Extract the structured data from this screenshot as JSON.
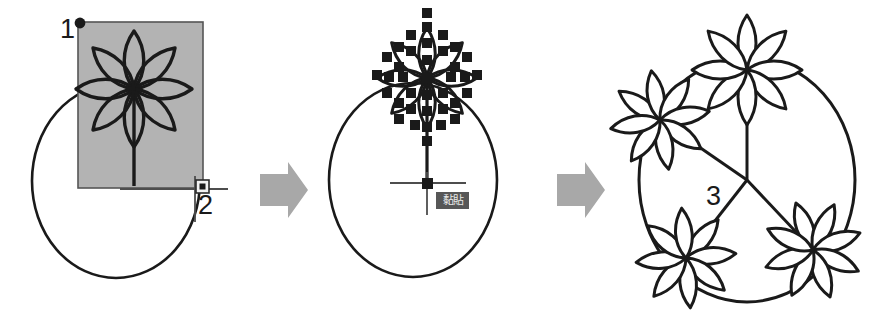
{
  "figure": {
    "background_color": "#ffffff",
    "stroke_color": "#1a1a1a",
    "selection_fill_color": "#b3b3b3",
    "arrow_color": "#a8a8a8",
    "tooltip_bg_color": "#575757",
    "tooltip_text_color": "#e8e8e8"
  },
  "steps": [
    {
      "id": "step-1",
      "label": "1",
      "caption": "1",
      "description": "Flower selected inside shaded selection rectangle on circle"
    },
    {
      "id": "step-2",
      "label": "2",
      "caption": "2",
      "description": "Base point picked at crosshair with square snap marker"
    },
    {
      "id": "step-3",
      "label": "3",
      "caption": "3",
      "description": "Grips shown on copied flower; paste destination point picked"
    }
  ],
  "panel_1": {
    "name": "selection-panel",
    "number_label": "1",
    "corner_label": "2",
    "selection_rect": {
      "fill": "#b3b3b3",
      "stroke": "#4d4d4d",
      "x": 78,
      "y": 22,
      "width": 125,
      "height": 166
    },
    "handle_dot": {
      "x": 80,
      "y": 23,
      "r": 5
    },
    "snap_marker": {
      "x": 201,
      "y": 188,
      "size": 11
    },
    "circle": {
      "cx": 116,
      "cy": 181,
      "r": 84
    },
    "flower": {
      "cx": 134,
      "cy": 89,
      "petals": 8,
      "radius": 58
    }
  },
  "panel_2": {
    "name": "grips-panel",
    "number_label": "3",
    "tooltip_text": "黏貼",
    "circle": {
      "cx": 103,
      "cy": 180,
      "r": 84
    },
    "flower": {
      "cx": 117,
      "cy": 78,
      "petals": 8,
      "radius": 50
    },
    "grip_color": "#1a1a1a",
    "grip_size": 9,
    "basepoint": {
      "x": 117,
      "y": 183
    }
  },
  "panel_3": {
    "name": "result-panel",
    "circle": {
      "cx": 139,
      "cy": 180,
      "r": 122
    },
    "center_node": {
      "x": 139,
      "y": 180
    },
    "flower_count": 4,
    "flower_angles_deg": [
      270,
      180,
      120,
      60
    ],
    "flower_petals": 8
  },
  "arrows": [
    {
      "name": "arrow-step-1-to-2",
      "direction": "right",
      "color": "#a8a8a8"
    },
    {
      "name": "arrow-step-2-to-3",
      "direction": "right",
      "color": "#a8a8a8"
    }
  ]
}
